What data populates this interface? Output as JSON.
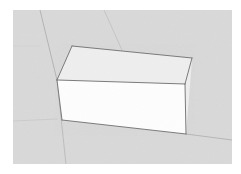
{
  "app": {
    "title": "3D Modeling Viewport",
    "kind": "3d-model-viewport-screenshot",
    "canvas": {
      "width": 241,
      "height": 174
    }
  },
  "colors": {
    "page_background": "#ffffff",
    "ground_plane": "#d9d9d9",
    "ground_plane_noise": "#d2d2d2",
    "ground_grid_line": "#9a9a9a",
    "ground_grid_line_faint": "#b8b8b8",
    "box_top_face": "#eeeeee",
    "box_front_face": "#fdfdfd",
    "box_right_face": "#e4e4e4",
    "box_edge": "#6e6e6e",
    "box_edge_soft": "#8d8d8d"
  },
  "viewport": {
    "name": "perspective-viewport",
    "ground": {
      "name": "ground-plane",
      "points": "13,10 232,10 232,164 13,164"
    },
    "grid_lines": [
      {
        "name": "grid-line-vertical-left",
        "x1": 40,
        "y1": 10,
        "x2": 57,
        "y2": 80,
        "width": 0.8,
        "opacity": 0.75
      },
      {
        "name": "grid-line-vertical-left-lower",
        "x1": 57,
        "y1": 80,
        "x2": 66,
        "y2": 164,
        "width": 0.8,
        "opacity": 0.55
      },
      {
        "name": "grid-line-diagonal-upper",
        "x1": 104,
        "y1": 10,
        "x2": 122,
        "y2": 50,
        "width": 0.7,
        "opacity": 0.45
      },
      {
        "name": "grid-line-horizon-right",
        "x1": 186,
        "y1": 134,
        "x2": 232,
        "y2": 140,
        "width": 0.8,
        "opacity": 0.7
      },
      {
        "name": "grid-line-horizon-left",
        "x1": 13,
        "y1": 121,
        "x2": 57,
        "y2": 119,
        "width": 0.7,
        "opacity": 0.3
      },
      {
        "name": "grid-line-far-top",
        "x1": 13,
        "y1": 46,
        "x2": 40,
        "y2": 46,
        "width": 0.7,
        "opacity": 0.12
      }
    ],
    "box": {
      "name": "rectangular-box-solid",
      "label": "box",
      "faces": [
        {
          "name": "box-face-top",
          "points": "72,46 192,58 185,84 57,80",
          "fill": "#eeeeee"
        },
        {
          "name": "box-face-front",
          "points": "57,80 185,84 186,134 62,120",
          "fill": "#fdfdfd"
        },
        {
          "name": "box-face-right",
          "points": "185,84 192,58 192,60 186,134",
          "fill": "#ededed"
        }
      ],
      "edges": [
        {
          "name": "box-edge-top-back",
          "x1": 72,
          "y1": 46,
          "x2": 192,
          "y2": 58
        },
        {
          "name": "box-edge-top-right",
          "x1": 192,
          "y1": 58,
          "x2": 185,
          "y2": 84
        },
        {
          "name": "box-edge-top-front",
          "x1": 57,
          "y1": 80,
          "x2": 185,
          "y2": 84
        },
        {
          "name": "box-edge-top-left",
          "x1": 72,
          "y1": 46,
          "x2": 57,
          "y2": 80
        },
        {
          "name": "box-edge-vertical-left",
          "x1": 57,
          "y1": 80,
          "x2": 62,
          "y2": 120
        },
        {
          "name": "box-edge-vertical-right",
          "x1": 185,
          "y1": 84,
          "x2": 186,
          "y2": 134
        },
        {
          "name": "box-edge-bottom-front",
          "x1": 62,
          "y1": 120,
          "x2": 186,
          "y2": 134
        }
      ]
    }
  }
}
